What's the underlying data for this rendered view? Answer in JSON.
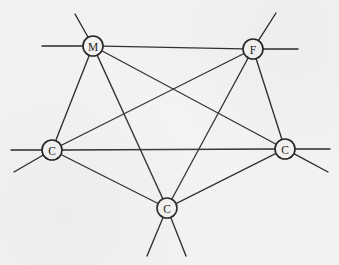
{
  "figure": {
    "width": 339,
    "height": 265,
    "background_color": "#f3f2f0",
    "ink_color": "#2b2b2b",
    "node_radius": 10
  },
  "nodes": [
    {
      "id": "m-top-left",
      "label": "M",
      "x": 93,
      "y": 46
    },
    {
      "id": "f-top-right",
      "label": "F",
      "x": 253,
      "y": 49
    },
    {
      "id": "c-left",
      "label": "C",
      "x": 52,
      "y": 150
    },
    {
      "id": "c-right",
      "label": "C",
      "x": 285,
      "y": 149
    },
    {
      "id": "c-bottom",
      "label": "C",
      "x": 167,
      "y": 208
    }
  ],
  "edges": [
    {
      "id": "edge-m-f",
      "from": "m-top-left",
      "to": "f-top-right"
    },
    {
      "id": "edge-m-cleft",
      "from": "m-top-left",
      "to": "c-left"
    },
    {
      "id": "edge-m-cright",
      "from": "m-top-left",
      "to": "c-right"
    },
    {
      "id": "edge-m-cbottom",
      "from": "m-top-left",
      "to": "c-bottom"
    },
    {
      "id": "edge-f-cleft",
      "from": "f-top-right",
      "to": "c-left"
    },
    {
      "id": "edge-f-cright",
      "from": "f-top-right",
      "to": "c-right"
    },
    {
      "id": "edge-f-cbottom",
      "from": "f-top-right",
      "to": "c-bottom"
    },
    {
      "id": "edge-cleft-cright",
      "from": "c-left",
      "to": "c-right"
    },
    {
      "id": "edge-cleft-cbottom",
      "from": "c-left",
      "to": "c-bottom"
    },
    {
      "id": "edge-cright-cbottom",
      "from": "c-right",
      "to": "c-bottom"
    }
  ],
  "stubs": [
    {
      "id": "stub-m-up",
      "node": "m-top-left",
      "x2": 75,
      "y2": 14
    },
    {
      "id": "stub-m-left",
      "node": "m-top-left",
      "x2": 42,
      "y2": 46
    },
    {
      "id": "stub-f-up",
      "node": "f-top-right",
      "x2": 276,
      "y2": 13
    },
    {
      "id": "stub-f-right",
      "node": "f-top-right",
      "x2": 298,
      "y2": 49
    },
    {
      "id": "stub-cleft-left",
      "node": "c-left",
      "x2": 11,
      "y2": 150
    },
    {
      "id": "stub-cleft-down",
      "node": "c-left",
      "x2": 14,
      "y2": 172
    },
    {
      "id": "stub-cright-right",
      "node": "c-right",
      "x2": 330,
      "y2": 149
    },
    {
      "id": "stub-cright-down",
      "node": "c-right",
      "x2": 328,
      "y2": 172
    },
    {
      "id": "stub-cbottom-dl",
      "node": "c-bottom",
      "x2": 147,
      "y2": 256
    },
    {
      "id": "stub-cbottom-dr",
      "node": "c-bottom",
      "x2": 186,
      "y2": 256
    }
  ],
  "chart_data": {
    "type": "diagram",
    "node_labels": [
      "M",
      "F",
      "C",
      "C",
      "C"
    ],
    "node_count": 5,
    "edge_count": 10,
    "stub_count": 10,
    "graph": "complete (K5)",
    "legend": []
  }
}
